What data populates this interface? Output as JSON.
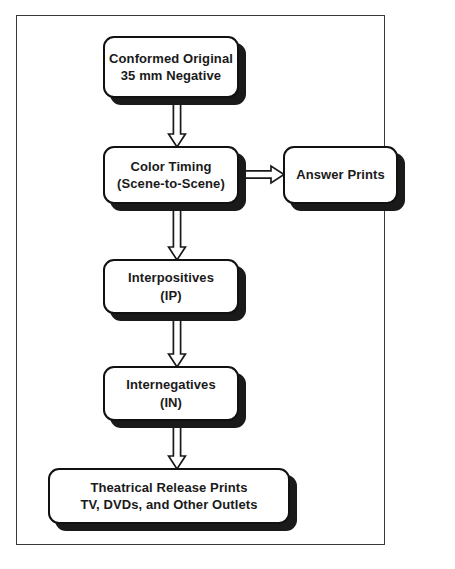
{
  "diagram": {
    "colors": {
      "frame_border": "#3a3a3a",
      "node_border": "#111111",
      "node_fill": "#ffffff",
      "shadow": "#1a1a1a",
      "text": "#1a1a1a"
    },
    "nodes": [
      {
        "id": "conformed",
        "label": "Conformed Original\n35 mm Negative",
        "line1": "Conformed Original",
        "line2": "35 mm Negative"
      },
      {
        "id": "color-timing",
        "label": "Color Timing\n(Scene-to-Scene)",
        "line1": "Color Timing",
        "line2": "(Scene-to-Scene)"
      },
      {
        "id": "answer-prints",
        "label": "Answer Prints",
        "line1": "Answer Prints",
        "line2": ""
      },
      {
        "id": "interpositives",
        "label": "Interpositives\n(IP)",
        "line1": "Interpositives",
        "line2": "(IP)"
      },
      {
        "id": "internegatives",
        "label": "Internegatives\n(IN)",
        "line1": "Internegatives",
        "line2": "(IN)"
      },
      {
        "id": "release",
        "label": "Theatrical Release Prints\nTV, DVDs, and Other Outlets",
        "line1": "Theatrical Release Prints",
        "line2": "TV, DVDs, and Other Outlets"
      }
    ],
    "connectors": [
      {
        "id": "conformed-to-color-timing",
        "from": "conformed",
        "to": "color-timing",
        "direction": "down"
      },
      {
        "id": "color-timing-to-answer-prints",
        "from": "color-timing",
        "to": "answer-prints",
        "direction": "right"
      },
      {
        "id": "color-timing-to-interpositives",
        "from": "color-timing",
        "to": "interpositives",
        "direction": "down"
      },
      {
        "id": "interpositives-to-internegatives",
        "from": "interpositives",
        "to": "internegatives",
        "direction": "down"
      },
      {
        "id": "internegatives-to-release",
        "from": "internegatives",
        "to": "release",
        "direction": "down"
      }
    ]
  }
}
